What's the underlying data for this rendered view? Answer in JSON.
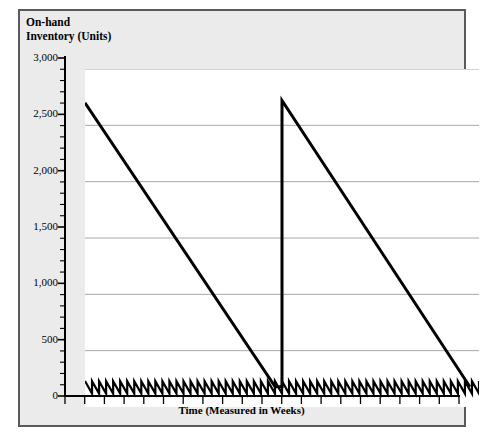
{
  "chart_data": {
    "type": "line",
    "title": "",
    "subtitle": "",
    "ylabel": "On-hand\nInventory (Units)",
    "xlabel": "Time (Measured in Weeks)",
    "ylim": [
      0,
      3000
    ],
    "xlim": [
      0,
      52
    ],
    "y_ticks": [
      0,
      500,
      1000,
      1500,
      2000,
      2500,
      3000
    ],
    "y_tick_labels": [
      "0",
      "500",
      "1,000",
      "1,500",
      "2,000",
      "2,500",
      "3,000"
    ],
    "y_minor_tick_interval": 100,
    "x_tick_interval_weeks": 2.6,
    "grid": "horizontal-major-only",
    "legend": "none",
    "series": [
      {
        "name": "Slow-moving inventory (two long depletion cycles)",
        "type": "sawtooth-large",
        "description": "Large sawtooth: stock starts at 2,700 units, depletes linearly to about 180 units, is instantly replenished back to 2,720 units, then depletes again to about 180 units.",
        "points": [
          {
            "x": 0.0,
            "y": 2700
          },
          {
            "x": 25.1,
            "y": 180
          },
          {
            "x": 26.0,
            "y": 180
          },
          {
            "x": 26.0,
            "y": 2720
          },
          {
            "x": 50.8,
            "y": 180
          }
        ],
        "color": "#000000",
        "line_width": 3
      },
      {
        "name": "Fast-moving inventory (weekly replenishment)",
        "type": "sawtooth-small",
        "description": "Small repeating sawtooth along the baseline: inventory oscillates between about 120 and 230 units with a weekly reorder cycle.",
        "baseline_low": 120,
        "baseline_high": 230,
        "cycles": 56,
        "color": "#000000",
        "line_width": 2.2
      }
    ]
  },
  "axis": {
    "y_title_line1": "On-hand",
    "y_title_line2": "Inventory (Units)",
    "x_title": "Time (Measured in Weeks)"
  },
  "colors": {
    "series": "#000000",
    "gridline": "#a8a8a8",
    "axis": "#000000",
    "frame_border": "#5a5a5a",
    "frame_background": "#ebebeb",
    "plot_background": "#ffffff"
  }
}
